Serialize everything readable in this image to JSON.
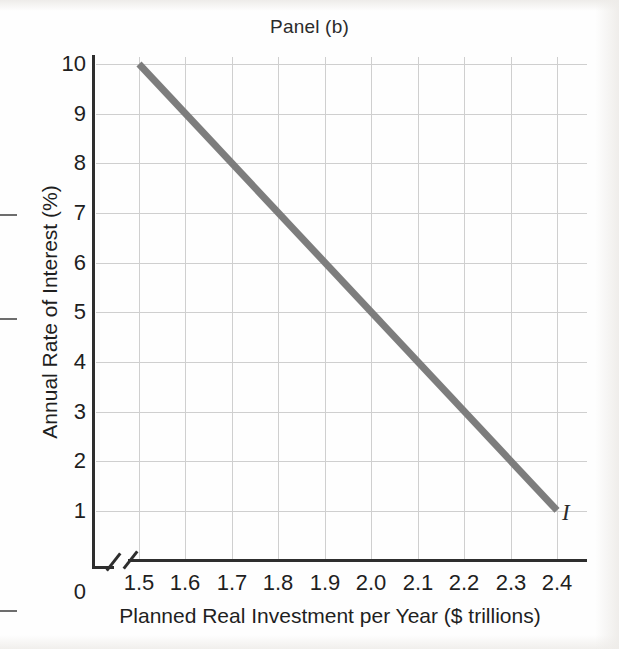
{
  "chart_data": {
    "type": "line",
    "title": "Panel (b)",
    "xlabel": "Planned Real Investment per Year ($ trillions)",
    "ylabel": "Annual Rate of Interest (%)",
    "xlim": [
      1.5,
      2.4
    ],
    "ylim": [
      0,
      10
    ],
    "grid": true,
    "legend_position": "none",
    "x_tick_labels": [
      "1.5",
      "1.6",
      "1.7",
      "1.8",
      "1.9",
      "2.0",
      "2.1",
      "2.2",
      "2.3",
      "2.4"
    ],
    "x_tick_values": [
      1.5,
      1.6,
      1.7,
      1.8,
      1.9,
      2.0,
      2.1,
      2.2,
      2.3,
      2.4
    ],
    "x_origin_label": "0",
    "y_tick_labels": [
      "1",
      "2",
      "3",
      "4",
      "5",
      "6",
      "7",
      "8",
      "9",
      "10"
    ],
    "y_tick_values": [
      1,
      2,
      3,
      4,
      5,
      6,
      7,
      8,
      9,
      10
    ],
    "y_origin_label": "0",
    "axis_break": true,
    "series": [
      {
        "name": "I",
        "annotation": "I",
        "color": "#7d7d7d",
        "line_width": 7,
        "x": [
          1.5,
          1.6,
          1.7,
          1.8,
          1.9,
          2.0,
          2.1,
          2.2,
          2.3,
          2.4
        ],
        "values": [
          10,
          9,
          8,
          7,
          6,
          5,
          4,
          3,
          2,
          1
        ]
      }
    ]
  },
  "colors": {
    "curve": "#7d7d7d",
    "axis": "#2e2e2e",
    "grid": "#cfcfcf",
    "text": "#1f1f1f"
  }
}
